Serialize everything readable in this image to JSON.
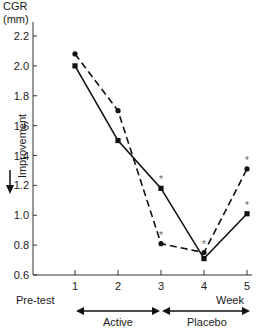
{
  "chart_data": {
    "type": "line",
    "title": "",
    "ylabel": "CGR (mm)",
    "ylabel_line1": "CGR",
    "ylabel_line2": "(mm)",
    "side_label": "Improvement",
    "xlabel": "Week",
    "x_pretest_label": "Pre-test",
    "x": [
      1,
      2,
      3,
      4,
      5
    ],
    "x_ticks": [
      "1",
      "2",
      "3",
      "4",
      "5"
    ],
    "y_ticks": [
      "2.2",
      "2.0",
      "1.8",
      "1.6",
      "1.4",
      "1.2",
      "1.0",
      "0.8",
      "0.6"
    ],
    "ylim": [
      0.6,
      2.2
    ],
    "grid": false,
    "series": [
      {
        "name": "solid",
        "style": "solid",
        "values": [
          2.0,
          1.5,
          1.18,
          0.71,
          1.01
        ],
        "significant": [
          false,
          false,
          true,
          false,
          true
        ]
      },
      {
        "name": "dashed",
        "style": "dashed",
        "values": [
          2.08,
          1.7,
          0.81,
          0.75,
          1.31
        ],
        "significant": [
          false,
          false,
          true,
          true,
          true
        ]
      }
    ],
    "annotations": {
      "significance_marker": "*",
      "phase_active": "Active",
      "phase_placebo": "Placebo"
    }
  }
}
